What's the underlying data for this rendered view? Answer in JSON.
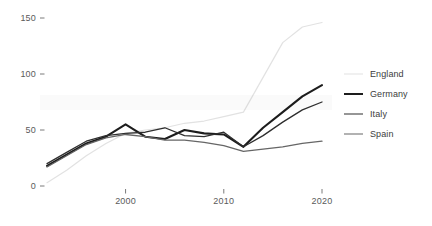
{
  "chart_data": {
    "type": "line",
    "title": "",
    "subtitle": "",
    "xlabel": "",
    "ylabel": "",
    "xlim": [
      1992,
      2020
    ],
    "ylim": [
      0,
      155
    ],
    "grid": false,
    "legend_position": "right",
    "x_ticks": [
      "2000",
      "2010",
      "2020"
    ],
    "x_tick_values": [
      2000,
      2010,
      2020
    ],
    "y_ticks": [
      "0",
      "50",
      "100",
      "150"
    ],
    "y_tick_values": [
      0,
      50,
      100,
      150
    ],
    "x": [
      1992,
      1994,
      1996,
      1998,
      2000,
      2002,
      2004,
      2006,
      2008,
      2010,
      2012,
      2014,
      2016,
      2018,
      2020
    ],
    "series": [
      {
        "name": "England",
        "color": "#e2e2e2",
        "width": 1.2,
        "values": [
          3,
          14,
          27,
          38,
          47,
          50,
          52,
          56,
          58,
          62,
          66,
          97,
          128,
          142,
          146
        ]
      },
      {
        "name": "Germany",
        "color": "#1d1d1d",
        "width": 2.1,
        "values": [
          18,
          28,
          38,
          44,
          55,
          44,
          42,
          50,
          47,
          46,
          35,
          52,
          66,
          80,
          90
        ]
      },
      {
        "name": "Italy",
        "color": "#2e2e2e",
        "width": 1.3,
        "values": [
          20,
          30,
          40,
          45,
          47,
          48,
          52,
          45,
          44,
          48,
          35,
          45,
          57,
          68,
          75
        ]
      },
      {
        "name": "Spain",
        "color": "#666666",
        "width": 1.3,
        "values": [
          17,
          27,
          37,
          43,
          46,
          44,
          41,
          41,
          39,
          36,
          31,
          33,
          35,
          38,
          40
        ]
      }
    ]
  },
  "legend": {
    "items": [
      {
        "label": "England"
      },
      {
        "label": "Germany"
      },
      {
        "label": "Italy"
      },
      {
        "label": "Spain"
      }
    ]
  }
}
